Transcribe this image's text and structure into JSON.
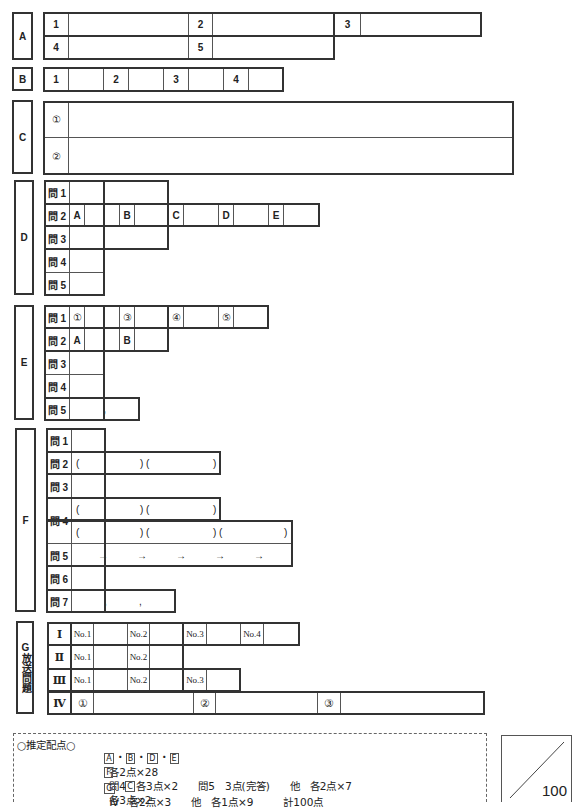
{
  "sections": {
    "A": {
      "label": "A",
      "items": [
        "1",
        "2",
        "3",
        "4",
        "5"
      ]
    },
    "B": {
      "label": "B",
      "items": [
        "1",
        "2",
        "3",
        "4"
      ]
    },
    "C": {
      "label": "C",
      "items": [
        "①",
        "②"
      ]
    },
    "D": {
      "label": "D",
      "questions": [
        "問 1",
        "問 2",
        "問 3",
        "問 4",
        "問 5"
      ],
      "q2_parts": [
        "A",
        "B",
        "C",
        "D",
        "E"
      ]
    },
    "E": {
      "label": "E",
      "questions": [
        "問 1",
        "問 2",
        "問 3",
        "問 4",
        "問 5"
      ],
      "q1_parts": [
        "①",
        "③",
        "④",
        "⑤"
      ],
      "q2_parts": [
        "A",
        "B"
      ],
      "q5_separator": ","
    },
    "F": {
      "label": "F",
      "questions": [
        "問 1",
        "問 2",
        "問 3",
        "問 4",
        "問 5",
        "問 6",
        "問 7"
      ],
      "paren_open": "(",
      "paren_mid": ") (",
      "paren_close": ")",
      "arrow": "→",
      "comma": ","
    },
    "G": {
      "label": "G放送問題",
      "rows": [
        "Ⅰ",
        "Ⅱ",
        "Ⅲ",
        "Ⅳ"
      ],
      "row1_parts": [
        "No.1",
        "No.2",
        "No.3",
        "No.4"
      ],
      "row2_parts": [
        "No.1",
        "No.2"
      ],
      "row3_parts": [
        "No.1",
        "No.2",
        "No.3"
      ],
      "row4_parts": [
        "①",
        "②",
        "③"
      ]
    }
  },
  "scoring": {
    "title": "○推定配点○",
    "line1": {
      "sections": [
        "A",
        "B",
        "D",
        "E"
      ],
      "sep": "・",
      "text": "各2点×28",
      "c_label": "C",
      "c_text": "各3点×2"
    },
    "line2": {
      "section": "F",
      "text": "問4　各3点×2　　問5　3点(完答)　　他　各2点×7"
    },
    "line3": {
      "section": "G",
      "text": "Ⅳ　各2点×3　　他　各1点×9　　　計100点"
    }
  },
  "total_score": {
    "max": "100"
  }
}
